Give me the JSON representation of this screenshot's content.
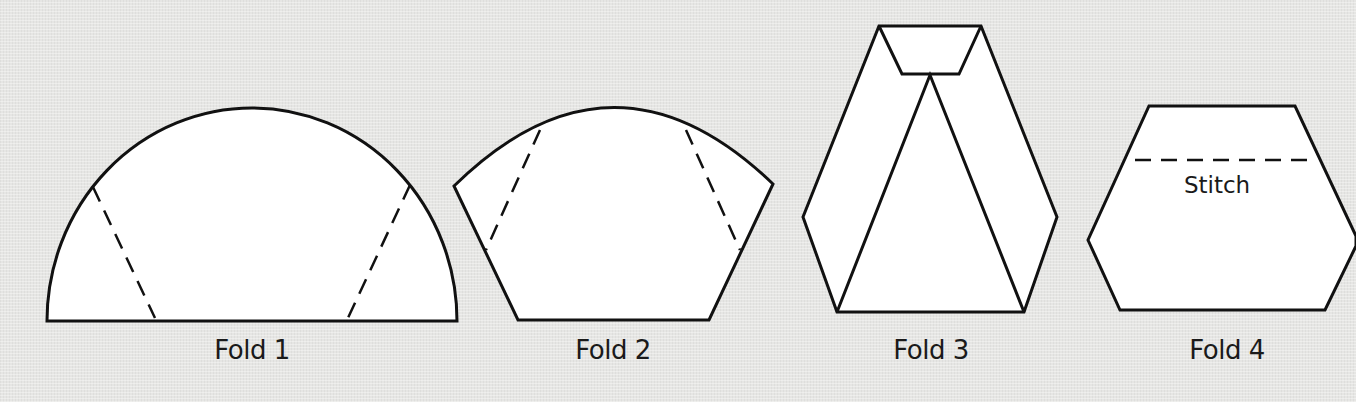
{
  "figure": {
    "type": "folding-instruction-diagram",
    "background_color": "#e6e6e4",
    "line_color": "#111111",
    "fill_color": "#ffffff",
    "steps": [
      {
        "id": "fold-1",
        "label": "Fold 1",
        "shape": "semicircle",
        "fold_lines": "two dashed diagonal lines from the arc down to the baseline"
      },
      {
        "id": "fold-2",
        "label": "Fold 2",
        "shape": "arc-topped trapezoid",
        "fold_lines": "two dashed diagonal lines near the slanted sides"
      },
      {
        "id": "fold-3",
        "label": "Fold 3",
        "shape": "hexagon with folded-down top flap and inner triangle",
        "fold_lines": "none"
      },
      {
        "id": "fold-4",
        "label": "Fold 4",
        "shape": "hexagon",
        "fold_lines": "one horizontal dashed stitch line",
        "annotation": "Stitch"
      }
    ]
  }
}
